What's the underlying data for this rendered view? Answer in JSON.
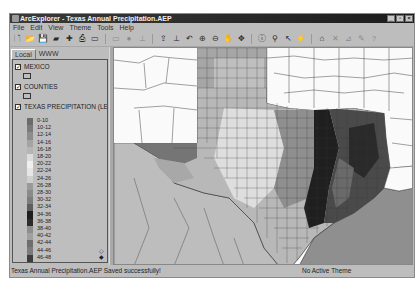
{
  "window": {
    "title": "ArcExplorer - Texas Annual Precipitation.AEP",
    "controls": [
      "minimize",
      "maximize",
      "close"
    ]
  },
  "menubar": {
    "items": [
      "File",
      "Edit",
      "View",
      "Theme",
      "Tools",
      "Help"
    ]
  },
  "toolbar": {
    "buttons": [
      {
        "name": "new-project-icon",
        "glyph": "🗋"
      },
      {
        "name": "open-project-icon",
        "glyph": "📂"
      },
      {
        "name": "save-project-icon",
        "glyph": "💾"
      },
      {
        "name": "catalog-icon",
        "glyph": "▰"
      },
      {
        "name": "add-theme-icon",
        "glyph": "✚"
      },
      {
        "name": "print-icon",
        "glyph": "⎙"
      },
      {
        "name": "layout-icon",
        "glyph": "▭"
      },
      {
        "name": "remove-theme-icon",
        "glyph": "▭",
        "disabled": true
      },
      {
        "name": "globe-icon",
        "glyph": "●",
        "disabled": true
      },
      {
        "name": "properties-icon",
        "glyph": "⊥",
        "disabled": true
      },
      {
        "name": "zoom-full-icon",
        "glyph": "⇪"
      },
      {
        "name": "zoom-active-icon",
        "glyph": "⊥"
      },
      {
        "name": "zoom-previous-icon",
        "glyph": "↶"
      },
      {
        "name": "zoom-in-icon",
        "glyph": "⊕"
      },
      {
        "name": "zoom-out-icon",
        "glyph": "⊖"
      },
      {
        "name": "pan-hand-icon",
        "glyph": "✋"
      },
      {
        "name": "pan-directional-icon",
        "glyph": "✥"
      },
      {
        "name": "identify-icon",
        "glyph": "ⓘ"
      },
      {
        "name": "find-icon",
        "glyph": "⚲"
      },
      {
        "name": "measure-icon",
        "glyph": "↖"
      },
      {
        "name": "hotlink-icon",
        "glyph": "⚡",
        "disabled": true
      },
      {
        "name": "select-feature-icon",
        "glyph": "⌂"
      },
      {
        "name": "clear-selection-icon",
        "glyph": "✕",
        "disabled": true
      },
      {
        "name": "query-builder-icon",
        "glyph": "⊿",
        "disabled": true
      },
      {
        "name": "edit-icon",
        "glyph": "✎",
        "disabled": true
      },
      {
        "name": "help-icon",
        "glyph": "?",
        "disabled": true
      }
    ]
  },
  "legend": {
    "tabs": [
      "Local",
      "WWW"
    ],
    "active_tab": "Local",
    "layers": [
      {
        "name": "MEXICO",
        "checked": true
      },
      {
        "name": "COUNTIES",
        "checked": true
      },
      {
        "name": "TEXAS PRECIPITATION (LEG",
        "checked": true
      }
    ],
    "classes": [
      {
        "label": "0-10",
        "color": "#6b6b6b"
      },
      {
        "label": "10-12",
        "color": "#7a7a7a"
      },
      {
        "label": "12-14",
        "color": "#8c8c8c"
      },
      {
        "label": "14-16",
        "color": "#a3a3a3"
      },
      {
        "label": "16-18",
        "color": "#b5b5b5"
      },
      {
        "label": "18-20",
        "color": "#dcdcdc"
      },
      {
        "label": "20-22",
        "color": "#f0f0f0"
      },
      {
        "label": "22-24",
        "color": "#e6e6e6"
      },
      {
        "label": "24-26",
        "color": "#cfcfcf"
      },
      {
        "label": "26-28",
        "color": "#9a9a9a"
      },
      {
        "label": "28-30",
        "color": "#8a8a8a"
      },
      {
        "label": "30-32",
        "color": "#7c7c7c"
      },
      {
        "label": "32-34",
        "color": "#5e5e5e"
      },
      {
        "label": "34-36",
        "color": "#1e1e1e"
      },
      {
        "label": "36-38",
        "color": "#2c2c2c"
      },
      {
        "label": "38-40",
        "color": "#8d8d8d"
      },
      {
        "label": "40-42",
        "color": "#a0a0a0"
      },
      {
        "label": "42-44",
        "color": "#6e6e6e"
      },
      {
        "label": "44-46",
        "color": "#7b7b7b"
      },
      {
        "label": "46-48",
        "color": "#3c3c3c"
      },
      {
        "label": "48-50",
        "color": "#353535"
      },
      {
        "label": "50-52",
        "color": "#4a4a4a"
      },
      {
        "label": "52-54",
        "color": "#545454"
      },
      {
        "label": "54-56",
        "color": "#828282"
      },
      {
        "label": "56-58",
        "color": "#939393"
      },
      {
        "label": "58-60",
        "color": "#9c9c9c"
      }
    ]
  },
  "statusbar": {
    "message": "Texas Annual Precipitation.AEP Saved successfully!",
    "active_theme": "No Active Theme"
  },
  "map": {
    "background": "#bdbdbd",
    "gulf_color": "#8f8f8f",
    "outside_color": "#fafafa"
  }
}
